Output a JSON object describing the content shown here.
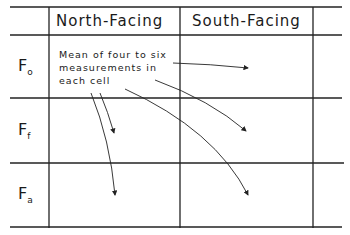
{
  "table": {
    "columns": [
      "",
      "North-Facing",
      "South-Facing",
      ""
    ],
    "rows": [
      {
        "symbol": "F",
        "subscript": "o"
      },
      {
        "symbol": "F",
        "subscript": "f"
      },
      {
        "symbol": "F",
        "subscript": "a"
      }
    ]
  },
  "annotation": {
    "lines": [
      "Mean of four to six",
      "measurements in",
      "each cell"
    ],
    "arrow_count": 5,
    "arrow_targets": [
      "South-Facing / F_o",
      "North-Facing / F_f",
      "North-Facing / F_a",
      "South-Facing / F_f",
      "South-Facing / F_a"
    ]
  },
  "colors": {
    "line": "#222222",
    "background": "#ffffff"
  }
}
